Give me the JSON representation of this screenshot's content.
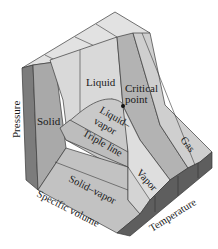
{
  "diagram": {
    "type": "3D P-v-T surface",
    "axes": {
      "pressure": "Pressure",
      "specific_volume": "Specific volume",
      "temperature": "Temperature"
    },
    "regions": {
      "solid": "Solid",
      "liquid": "Liquid",
      "gas": "Gas",
      "vapor": "Vapor",
      "liquid_vapor_line1": "Liquid–",
      "liquid_vapor_line2": "vapor",
      "solid_vapor": "Solid–vapor"
    },
    "annotations": {
      "critical_point_line1": "Critical",
      "critical_point_line2": "point",
      "triple_line": "Triple line"
    },
    "colors": {
      "top_face": "#dcdcdc",
      "light": "#d6d6d6",
      "mid": "#b9b9b9",
      "dark": "#8a8a8a",
      "darker": "#6d6d6d",
      "edge": "#3a3a3a"
    }
  }
}
